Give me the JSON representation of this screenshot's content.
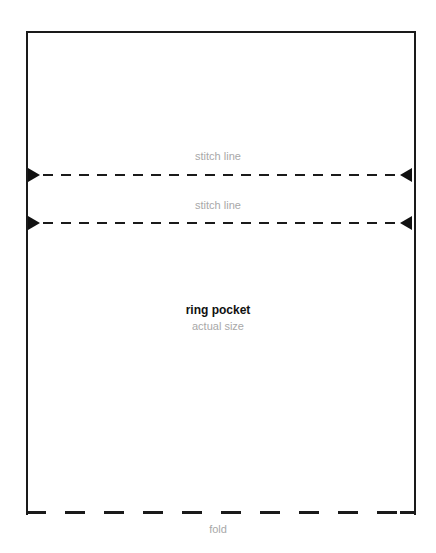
{
  "pattern": {
    "title": "ring pocket",
    "subtitle": "actual size",
    "stitch_lines": [
      {
        "label": "stitch line"
      },
      {
        "label": "stitch line"
      }
    ],
    "fold_label": "fold"
  },
  "colors": {
    "line": "#1a1a1a",
    "label_gray": "#a8a8a8"
  }
}
